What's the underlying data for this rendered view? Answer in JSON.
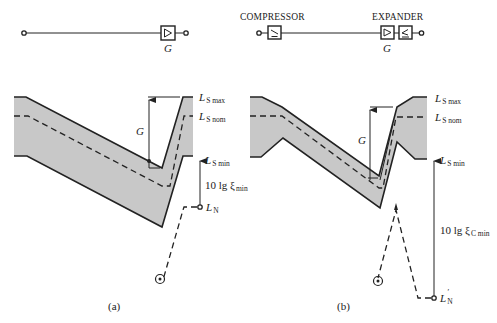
{
  "panel_a": {
    "block": {
      "gain_label": "G"
    },
    "levels": {
      "ls_max": {
        "main": "L",
        "sub": "S max"
      },
      "ls_nom": {
        "main": "L",
        "sub": "S nom"
      },
      "ls_min": {
        "main": "L",
        "sub": "S min"
      },
      "ln": {
        "main": "L",
        "sub": "N"
      }
    },
    "gain_arrow_label": "G",
    "dynamic_label": {
      "main": "10 lg ξ",
      "sub": "min"
    },
    "caption": "(a)"
  },
  "panel_b": {
    "compressor_label": "COMPRESSOR",
    "expander_label": "EXPANDER",
    "block": {
      "gain_label": "G"
    },
    "levels": {
      "ls_max": {
        "main": "L",
        "sub": "S max"
      },
      "ls_nom": {
        "main": "L",
        "sub": "S nom"
      },
      "ls_min": {
        "main": "L",
        "sub": "S min"
      },
      "ln_prime": {
        "main": "L",
        "sup": "′",
        "sub": "N"
      }
    },
    "gain_arrow_label": "G",
    "dynamic_label": {
      "main": "10 lg ξ",
      "sub": "C min"
    },
    "caption": "(b)"
  },
  "colors": {
    "band_fill": "#c8c8c8",
    "line": "#222222"
  }
}
